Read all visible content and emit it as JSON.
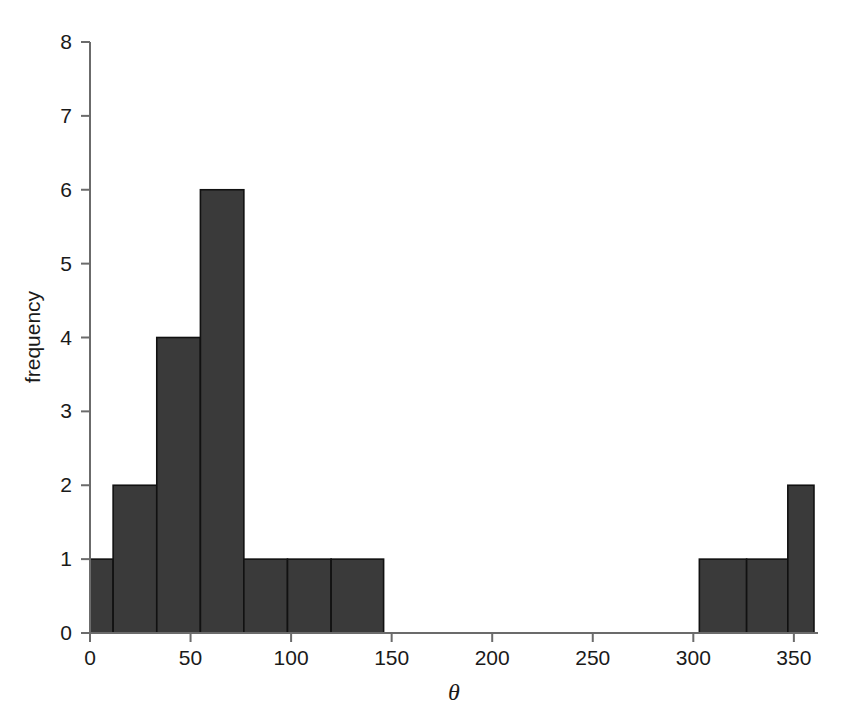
{
  "chart_data": {
    "type": "bar",
    "subtype": "histogram",
    "title": "",
    "xlabel": "θ",
    "ylabel": "frequency",
    "xlim": [
      0,
      362
    ],
    "ylim": [
      0,
      8
    ],
    "grid": false,
    "legend": null,
    "bar_color": "#3a3a3a",
    "bar_edge_color": "#111111",
    "axis_color": "#6b6b6b",
    "xticks": [
      0,
      50,
      100,
      150,
      200,
      250,
      300,
      350
    ],
    "xtick_labels": [
      "0",
      "50",
      "100",
      "150",
      "200",
      "250",
      "300",
      "350"
    ],
    "yticks": [
      0,
      1,
      2,
      3,
      4,
      5,
      6,
      7,
      8
    ],
    "ytick_labels": [
      "0",
      "1",
      "2",
      "3",
      "4",
      "5",
      "6",
      "7",
      "8"
    ],
    "bin_edges": [
      0,
      11.5,
      33.2,
      54.9,
      76.5,
      98.2,
      119.9,
      146.0,
      303.0,
      326.5,
      347.0,
      360.0
    ],
    "bins": [
      {
        "x0": 0,
        "x1": 11.5,
        "count": 1
      },
      {
        "x0": 11.5,
        "x1": 33.2,
        "count": 2
      },
      {
        "x0": 33.2,
        "x1": 54.9,
        "count": 4
      },
      {
        "x0": 54.9,
        "x1": 76.5,
        "count": 6
      },
      {
        "x0": 76.5,
        "x1": 98.2,
        "count": 1
      },
      {
        "x0": 98.2,
        "x1": 119.9,
        "count": 1
      },
      {
        "x0": 119.9,
        "x1": 146.0,
        "count": 1
      },
      {
        "x0": 303.0,
        "x1": 326.5,
        "count": 1
      },
      {
        "x0": 326.5,
        "x1": 347.0,
        "count": 1
      },
      {
        "x0": 347.0,
        "x1": 360.0,
        "count": 2
      }
    ],
    "values": [
      1,
      2,
      4,
      6,
      1,
      1,
      1,
      1,
      1,
      2
    ],
    "categories": [
      "0-11.5",
      "11.5-33.2",
      "33.2-54.9",
      "54.9-76.5",
      "76.5-98.2",
      "98.2-119.9",
      "119.9-146",
      "303-326.5",
      "326.5-347",
      "347-360"
    ],
    "total_count": 20
  },
  "geometry": {
    "plot_left": 90,
    "plot_right": 818,
    "plot_top": 42,
    "plot_bottom": 633,
    "x_per_unit": 2.0155,
    "y_per_unit": 73.875
  }
}
